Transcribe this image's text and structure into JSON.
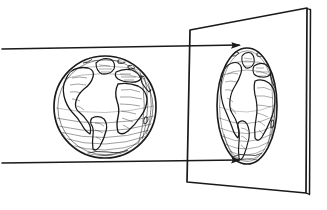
{
  "figure": {
    "caption": "",
    "medium": "line engraving",
    "background_color": "#ffffff",
    "ink_color": "#1a1a1a",
    "width": 327,
    "height": 210
  },
  "objects": {
    "globe": {
      "label": "terrestrial globe",
      "shape": "sphere",
      "center_x": 105,
      "center_y": 107,
      "radius": 51,
      "view": "Atlantic-centred hemisphere",
      "features": [
        "North America",
        "South America",
        "Europe",
        "Africa",
        "Greenland",
        "Antarctic ice rim"
      ]
    },
    "screen": {
      "label": "projection plane",
      "shape": "quadrilateral in perspective",
      "corners": [
        [
          190,
          30
        ],
        [
          307,
          8
        ],
        [
          306,
          193
        ],
        [
          187,
          182
        ]
      ],
      "edge_thickness": 4
    },
    "projected_image": {
      "label": "projected image of the globe",
      "shape": "ellipse",
      "center_x": 247,
      "center_y": 106,
      "radius_x": 30,
      "radius_y": 58,
      "note": "horizontally foreshortened orthographic projection"
    },
    "rays": {
      "label": "parallel projecting rays",
      "count": 2,
      "lines": [
        {
          "x1": 2,
          "y1": 49,
          "x2": 239,
          "y2": 45,
          "arrow": true
        },
        {
          "x1": 2,
          "y1": 163,
          "x2": 239,
          "y2": 160,
          "arrow": true
        }
      ],
      "arrowhead": "solid triangle"
    }
  }
}
